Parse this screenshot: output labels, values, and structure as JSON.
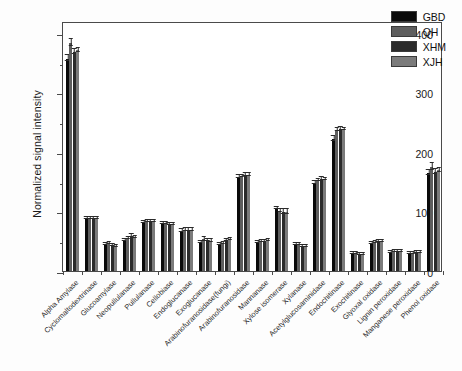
{
  "chart_data": {
    "type": "bar",
    "title": "",
    "subtitle": "",
    "xlabel": "",
    "ylabel": "Normalized signal intensity",
    "ylim": [
      0,
      420
    ],
    "yticks": [
      0,
      100,
      200,
      300,
      400
    ],
    "yminorticks": [
      50,
      150,
      250,
      350
    ],
    "grid": false,
    "legend_position": "top-right",
    "orientation": "vertical",
    "error_bars": true,
    "categories": [
      "Alpha Amylase",
      "Cyclomaltodextrinase",
      "Glucoamylase",
      "Neopullulanase",
      "Pullulanase",
      "Cellobiase",
      "Endoglucanase",
      "Exoglucanase",
      "Arabinofuranosidase(fungi)",
      "Arabinofuranosidase",
      "Mannanase",
      "Xylose isomerase",
      "Xylanase",
      "Acetylglucosaminidase",
      "Endochitinase",
      "Exochitinase",
      "Glyoxal oxidase",
      "Lignin peroxidase",
      "Manganese peroxidase",
      "Phenol oxidase"
    ],
    "series": [
      {
        "name": "GBD",
        "color": "#0a0a0a",
        "values": [
          357,
          88,
          44,
          51,
          81,
          79,
          67,
          48,
          45,
          158,
          48,
          105,
          44,
          148,
          222,
          29,
          47,
          31,
          29,
          164
        ],
        "errors": [
          6,
          2,
          2,
          2,
          2,
          2,
          3,
          3,
          2,
          3,
          2,
          3,
          2,
          3,
          5,
          2,
          2,
          2,
          2,
          5
        ]
      },
      {
        "name": "QH",
        "color": "#5e5e5e",
        "values": [
          383,
          89,
          46,
          55,
          83,
          79,
          69,
          53,
          47,
          159,
          49,
          101,
          44,
          152,
          237,
          29,
          48,
          32,
          30,
          175
        ],
        "errors": [
          7,
          2,
          2,
          3,
          2,
          2,
          3,
          4,
          2,
          3,
          2,
          4,
          2,
          3,
          4,
          2,
          2,
          2,
          2,
          7
        ]
      },
      {
        "name": "XHM",
        "color": "#2b2b2b",
        "values": [
          368,
          89,
          43,
          59,
          83,
          78,
          69,
          51,
          52,
          161,
          50,
          99,
          42,
          154,
          238,
          28,
          50,
          33,
          31,
          166
        ],
        "errors": [
          5,
          2,
          2,
          3,
          2,
          2,
          3,
          3,
          2,
          3,
          2,
          5,
          2,
          4,
          4,
          2,
          2,
          2,
          2,
          5
        ]
      },
      {
        "name": "XJH",
        "color": "#7b7b7b",
        "values": [
          371,
          89,
          42,
          56,
          83,
          78,
          69,
          50,
          53,
          161,
          51,
          99,
          42,
          154,
          238,
          27,
          50,
          32,
          31,
          169
        ],
        "errors": [
          4,
          2,
          2,
          3,
          2,
          2,
          3,
          3,
          2,
          3,
          2,
          5,
          2,
          3,
          3,
          2,
          2,
          2,
          2,
          4
        ]
      }
    ]
  },
  "legend": {
    "entries": [
      {
        "label": "GBD",
        "color": "#0a0a0a"
      },
      {
        "label": "QH",
        "color": "#5e5e5e"
      },
      {
        "label": "XHM",
        "color": "#2b2b2b"
      },
      {
        "label": "XJH",
        "color": "#7b7b7b"
      }
    ]
  },
  "axis": {
    "y_title": "Normalized signal intensity"
  }
}
